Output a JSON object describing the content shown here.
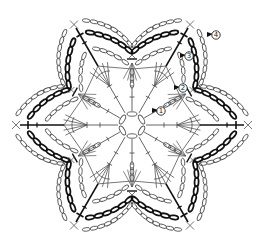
{
  "diagram": {
    "type": "crochet-chart",
    "center": {
      "x": 132,
      "y": 125
    },
    "points": 6,
    "colors": {
      "line": "#555555",
      "bold": "#111111",
      "background": "#ffffff"
    },
    "round_markers": [
      {
        "label": "1",
        "x": 161,
        "y": 111
      },
      {
        "label": "2",
        "x": 183,
        "y": 88
      },
      {
        "label": "3",
        "x": 189,
        "y": 56
      },
      {
        "label": "4",
        "x": 216,
        "y": 35
      }
    ],
    "rounds": [
      {
        "round": 1,
        "stitches": "chain ring with 6 spokes"
      },
      {
        "round": 2,
        "stitches": "tall stitch fans at each spoke"
      },
      {
        "round": 3,
        "stitches": "chain loops"
      },
      {
        "round": 4,
        "stitches": "bold chain arcs with outer chain arcs and picot tips"
      }
    ]
  }
}
